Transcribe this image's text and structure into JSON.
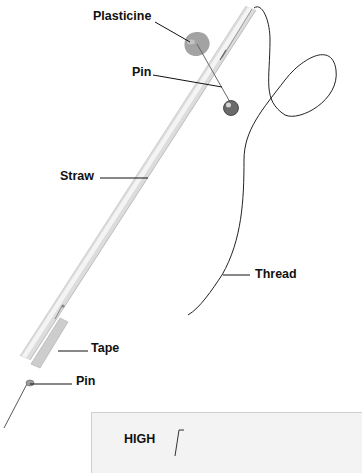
{
  "diagram": {
    "title": "",
    "labels": {
      "plasticine": "Plasticine",
      "pin_top": "Pin",
      "straw": "Straw",
      "thread": "Thread",
      "tape": "Tape",
      "pin_bottom": "Pin"
    },
    "inset_card": {
      "label": "HIGH"
    },
    "colors": {
      "straw": "#e2e2e2",
      "plasticine": "#9a9a9a",
      "pin_head": "#555555",
      "thread": "#222222",
      "leader_lines": "#111111"
    }
  }
}
